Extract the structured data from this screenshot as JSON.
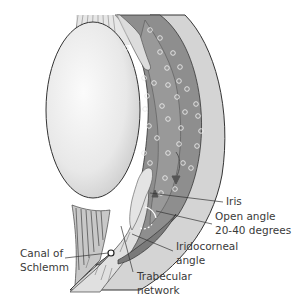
{
  "diagram": {
    "labels": {
      "iris": "Iris",
      "open_angle_line1": "Open angle",
      "open_angle_line2": "20-40 degrees",
      "iridocorneal_line1": "Iridocorneal",
      "iridocorneal_line2": "angle",
      "canal_line1": "Canal of",
      "canal_line2": "Schlemm",
      "trabecular_line1": "Trabecular",
      "trabecular_line2": "network"
    },
    "colors": {
      "lens": "#e9e9e9",
      "iris_dark": "#8c8c8c",
      "ciliary": "#a9a9a9",
      "cornea": "#d3d3d3",
      "outline": "#333333",
      "dots": "#e8e8e8",
      "text": "#3a3a3a"
    }
  }
}
